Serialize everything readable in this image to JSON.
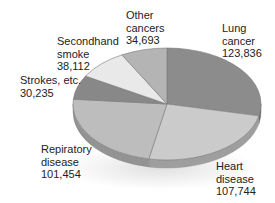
{
  "chart_data": {
    "type": "pie",
    "style": "3d-tilted",
    "title": "",
    "unit": "annual deaths",
    "slices": [
      {
        "label": "Lung cancer",
        "line1": "Lung",
        "line2": "cancer",
        "value": 123836,
        "value_text": "123,836",
        "color": "#8c8c8c"
      },
      {
        "label": "Heart disease",
        "line1": "Heart",
        "line2": "disease",
        "value": 107744,
        "value_text": "107,744",
        "color": "#cbcbcb"
      },
      {
        "label": "Repiratory disease",
        "line1": "Repiratory",
        "line2": "disease",
        "value": 101454,
        "value_text": "101,454",
        "color": "#bdbdbd"
      },
      {
        "label": "Strokes, etc.",
        "line1": "Strokes, etc.",
        "line2": "",
        "value": 30235,
        "value_text": "30,235",
        "color": "#888888"
      },
      {
        "label": "Secondhand smoke",
        "line1": "Secondhand",
        "line2": "smoke",
        "value": 38112,
        "value_text": "38,112",
        "color": "#e9e9e9"
      },
      {
        "label": "Other cancers",
        "line1": "Other",
        "line2": "cancers",
        "value": 34693,
        "value_text": "34,693",
        "color": "#b4b4b4"
      }
    ],
    "legend": "none (direct labels)"
  },
  "geometry": {
    "cx": 167,
    "cy": 104,
    "rx": 94,
    "ry": 56,
    "depth": 8,
    "start_angle_deg": -90
  },
  "colors": {
    "side_shade": 0.78,
    "divider": "#7a7a7a",
    "text": "#222222"
  }
}
